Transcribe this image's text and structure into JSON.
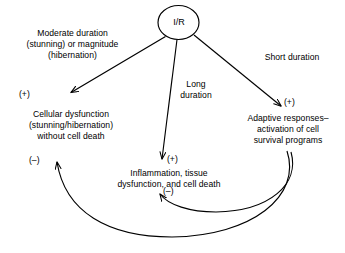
{
  "diagram": {
    "background_color": "#ffffff",
    "stroke_color": "#000000",
    "text_color": "#000000",
    "node": {
      "label": "I/R",
      "shape": "ellipse"
    },
    "labels": {
      "moderate": "Moderate duration\n(stunning) or magnitude\n(hibernation)",
      "long": "Long\nduration",
      "short": "Short duration",
      "cellular": "Cellular dysfunction\n(stunning/hibernation)\nwithout cell death",
      "inflammation": "Inflammation, tissue\ndysfunction, and cell death",
      "adaptive": "Adaptive responses–\nactivation of cell\nsurvival programs"
    },
    "signs": {
      "plus_left": "(+)",
      "plus_center": "(+)",
      "plus_right": "(+)",
      "minus_left": "(–)",
      "minus_center": "(–)"
    },
    "edges": [
      {
        "name": "ir-to-cellular",
        "from": "I/R",
        "to": "Cellular dysfunction (stunning/hibernation) without cell death",
        "sign": "(+)",
        "condition": "Moderate duration (stunning) or magnitude (hibernation)",
        "style": "straight-arrow"
      },
      {
        "name": "ir-to-inflammation",
        "from": "I/R",
        "to": "Inflammation, tissue dysfunction, and cell death",
        "sign": "(+)",
        "condition": "Long duration",
        "style": "straight-arrow"
      },
      {
        "name": "ir-to-adaptive",
        "from": "I/R",
        "to": "Adaptive responses–activation of cell survival programs",
        "sign": "(+)",
        "condition": "Short duration",
        "style": "straight-arrow"
      },
      {
        "name": "adaptive-to-inflammation",
        "from": "Adaptive responses–activation of cell survival programs",
        "to": "Inflammation, tissue dysfunction, and cell death",
        "sign": "(–)",
        "condition": "",
        "style": "curved-arrow"
      },
      {
        "name": "adaptive-to-cellular",
        "from": "Adaptive responses–activation of cell survival programs",
        "to": "Cellular dysfunction (stunning/hibernation) without cell death",
        "sign": "(–)",
        "condition": "",
        "style": "curved-arrow"
      }
    ]
  }
}
